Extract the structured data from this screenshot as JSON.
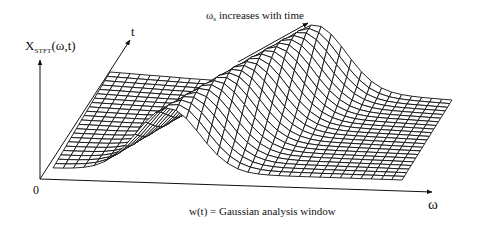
{
  "figure": {
    "y_axis_label": {
      "main": "X",
      "subscript": "STFT",
      "suffix": "(ω,t)"
    },
    "t_axis_label": "t",
    "omega_axis_label": "ω",
    "origin_label": "0",
    "annotation": {
      "symbol": "ω",
      "subscript": "s",
      "text": " increases with time"
    },
    "caption": "w(t) = Gaussian analysis window"
  },
  "chart_data": {
    "type": "surface",
    "title": "",
    "xlabel": "ω",
    "ylabel": "t",
    "zlabel": "X_STFT(ω,t)",
    "annotations": [
      "ω_s increases with time",
      "w(t) = Gaussian analysis window"
    ],
    "surface": {
      "grid_omega": 34,
      "grid_t": 22,
      "ridge_center_omega_front": 0.33,
      "ridge_center_omega_back": 0.6,
      "ridge_width": 0.09,
      "ridge_height": 64
    },
    "projection": {
      "front_left": [
        53,
        168
      ],
      "front_right": [
        402,
        180
      ],
      "back_left": [
        110,
        72
      ],
      "back_right": [
        452,
        100
      ]
    }
  }
}
